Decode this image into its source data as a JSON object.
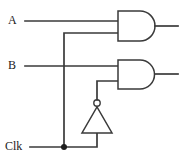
{
  "diagram": {
    "width": 182,
    "height": 163,
    "background_color": "#ffffff",
    "line_color": "#3a3a3a",
    "junction_color": "#1d1d1d"
  },
  "inputs": [
    {
      "id": "A",
      "label": "A",
      "wire_y": 21
    },
    {
      "id": "B",
      "label": "B",
      "wire_y": 66
    },
    {
      "id": "Clk",
      "label": "Clk",
      "wire_y": 147
    }
  ],
  "gates": [
    {
      "id": "and-top",
      "type": "AND",
      "inputs": [
        "A",
        "Clk"
      ],
      "x": 118,
      "y": 11,
      "width": 38,
      "height": 30
    },
    {
      "id": "and-bottom",
      "type": "AND",
      "inputs": [
        "B",
        "Clk-inverted"
      ],
      "x": 118,
      "y": 60,
      "width": 38,
      "height": 29
    },
    {
      "id": "inverter",
      "type": "NOT",
      "inputs": [
        "Clk"
      ],
      "orientation": "up",
      "apex_x": 97,
      "apex_y": 107,
      "base_y": 133,
      "base_left_x": 82,
      "base_right_x": 112,
      "bubble_cx": 97,
      "bubble_cy": 103,
      "bubble_r": 3.2
    }
  ],
  "nodes": {
    "clk_junction": {
      "x": 64,
      "y": 147
    }
  },
  "outputs": [
    {
      "id": "out-top",
      "from_gate": "and-top",
      "y": 26,
      "x_end": 178
    },
    {
      "id": "out-bottom",
      "from_gate": "and-bottom",
      "y": 74,
      "x_end": 178
    }
  ]
}
